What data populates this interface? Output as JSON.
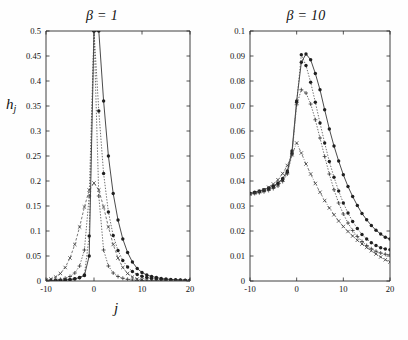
{
  "figure": {
    "background": "#fefefe",
    "ink_color": "#1f1f1f"
  },
  "panels": [
    {
      "id": "left",
      "title_symbol": "β",
      "title_eq": "=",
      "title_value": "1",
      "title_full": "β = 1",
      "ylabel": "h",
      "ylabel_sub": "j",
      "xlabel": "j"
    },
    {
      "id": "right",
      "title_symbol": "β",
      "title_eq": "=",
      "title_value": "10",
      "title_full": "β = 10",
      "ylabel": "h",
      "ylabel_sub": "j",
      "xlabel": "j"
    }
  ],
  "chart_data": [
    {
      "type": "line",
      "panel": "left",
      "title": "β = 1",
      "xlabel": "j",
      "ylabel": "h_j",
      "xlim": [
        -10,
        20
      ],
      "ylim": [
        0,
        0.5
      ],
      "xticks": [
        -10,
        0,
        10,
        20
      ],
      "xticklabels": [
        "-10",
        "0",
        "10",
        "20"
      ],
      "yticks": [
        0,
        0.05,
        0.1,
        0.15,
        0.2,
        0.25,
        0.3,
        0.35,
        0.4,
        0.45,
        0.5
      ],
      "yticklabels": [
        "0",
        "0.05",
        "0.1",
        "0.15",
        "0.2",
        "0.25",
        "0.3",
        "0.35",
        "0.4",
        "0.45",
        "0.5"
      ],
      "grid": false,
      "legend": "none",
      "x": [
        -10,
        -9,
        -8,
        -7,
        -6,
        -5,
        -4,
        -3,
        -2,
        -1,
        0,
        1,
        2,
        3,
        4,
        5,
        6,
        7,
        8,
        9,
        10,
        11,
        12,
        13,
        14,
        15,
        16,
        17,
        18,
        19,
        20
      ],
      "series": [
        {
          "name": "curve-1",
          "style": "solid",
          "marker": "filled-circle",
          "values": [
            0.0005,
            0.0007,
            0.001,
            0.0014,
            0.002,
            0.003,
            0.0045,
            0.007,
            0.011,
            0.05,
            0.5,
            0.5,
            0.36,
            0.25,
            0.175,
            0.122,
            0.084,
            0.057,
            0.038,
            0.025,
            0.017,
            0.012,
            0.009,
            0.007,
            0.005,
            0.004,
            0.003,
            0.0025,
            0.002,
            0.0017,
            0.0015
          ]
        },
        {
          "name": "curve-2",
          "style": "dotted",
          "marker": "filled-circle",
          "values": [
            0.0004,
            0.0006,
            0.0009,
            0.0013,
            0.0019,
            0.0028,
            0.0042,
            0.0065,
            0.012,
            0.09,
            0.5,
            0.34,
            0.215,
            0.138,
            0.091,
            0.061,
            0.041,
            0.028,
            0.019,
            0.013,
            0.0095,
            0.007,
            0.0055,
            0.0042,
            0.0033,
            0.0027,
            0.0022,
            0.0018,
            0.0015,
            0.0013,
            0.0011
          ]
        },
        {
          "name": "curve-3",
          "style": "dotted",
          "marker": "plus",
          "values": [
            0.0008,
            0.0012,
            0.002,
            0.0033,
            0.0055,
            0.009,
            0.016,
            0.03,
            0.062,
            0.17,
            0.5,
            0.17,
            0.062,
            0.03,
            0.016,
            0.009,
            0.0055,
            0.0033,
            0.002,
            0.0013,
            0.0009,
            0.0007,
            0.0005,
            0.0004,
            0.0003,
            0.00025,
            0.0002,
            0.00017,
            0.00015,
            0.00013,
            0.0001
          ]
        },
        {
          "name": "curve-4",
          "style": "dashed",
          "marker": "cross",
          "values": [
            0.002,
            0.004,
            0.008,
            0.015,
            0.027,
            0.046,
            0.073,
            0.108,
            0.148,
            0.182,
            0.196,
            0.182,
            0.148,
            0.108,
            0.073,
            0.046,
            0.027,
            0.015,
            0.008,
            0.004,
            0.002,
            0.0012,
            0.0008,
            0.0005,
            0.0004,
            0.0003,
            0.0002,
            0.00015,
            0.0001,
            8e-05,
            6e-05
          ]
        }
      ]
    },
    {
      "type": "line",
      "panel": "right",
      "title": "β = 10",
      "xlabel": "j",
      "ylabel": "h_j",
      "xlim": [
        -10,
        20
      ],
      "ylim": [
        0,
        0.1
      ],
      "xticks": [
        -10,
        0,
        10,
        20
      ],
      "xticklabels": [
        "-10",
        "0",
        "10",
        "20"
      ],
      "yticks": [
        0,
        0.01,
        0.02,
        0.03,
        0.04,
        0.05,
        0.06,
        0.07,
        0.08,
        0.09,
        0.1
      ],
      "yticklabels": [
        "0",
        "0.01",
        "0.02",
        "0.03",
        "0.04",
        "0.05",
        "0.06",
        "0.07",
        "0.08",
        "0.09",
        "0.1"
      ],
      "grid": false,
      "legend": "none",
      "x": [
        -10,
        -9,
        -8,
        -7,
        -6,
        -5,
        -4,
        -3,
        -2,
        -1,
        0,
        1,
        2,
        3,
        4,
        5,
        6,
        7,
        8,
        9,
        10,
        11,
        12,
        13,
        14,
        15,
        16,
        17,
        18,
        19,
        20
      ],
      "series": [
        {
          "name": "curve-1",
          "style": "solid",
          "marker": "filled-circle",
          "values": [
            0.035,
            0.0355,
            0.036,
            0.0365,
            0.0372,
            0.038,
            0.0392,
            0.041,
            0.044,
            0.052,
            0.072,
            0.0875,
            0.0908,
            0.0885,
            0.083,
            0.0765,
            0.0685,
            0.0608,
            0.054,
            0.048,
            0.0425,
            0.0378,
            0.0338,
            0.0302,
            0.027,
            0.0245,
            0.0222,
            0.0203,
            0.0188,
            0.0175,
            0.0168
          ]
        },
        {
          "name": "curve-2",
          "style": "dotted",
          "marker": "filled-circle",
          "values": [
            0.035,
            0.0353,
            0.0357,
            0.0362,
            0.0368,
            0.0376,
            0.0388,
            0.0405,
            0.0435,
            0.0512,
            0.0715,
            0.0905,
            0.0862,
            0.0795,
            0.0715,
            0.0632,
            0.0552,
            0.0478,
            0.0415,
            0.036,
            0.0312,
            0.0272,
            0.0238,
            0.021,
            0.0186,
            0.0168,
            0.0153,
            0.0142,
            0.0133,
            0.0128,
            0.0125
          ]
        },
        {
          "name": "curve-3",
          "style": "dotted",
          "marker": "plus",
          "values": [
            0.0348,
            0.035,
            0.0353,
            0.0357,
            0.0362,
            0.037,
            0.038,
            0.0398,
            0.0428,
            0.0505,
            0.0705,
            0.0765,
            0.0752,
            0.0708,
            0.0645,
            0.0572,
            0.0498,
            0.0428,
            0.0365,
            0.0312,
            0.0268,
            0.0232,
            0.0202,
            0.0178,
            0.0158,
            0.0142,
            0.0129,
            0.0119,
            0.0112,
            0.0107,
            0.0105
          ]
        },
        {
          "name": "curve-4",
          "style": "dashdot",
          "marker": "cross",
          "values": [
            0.0348,
            0.0352,
            0.0358,
            0.0365,
            0.0375,
            0.0388,
            0.0405,
            0.043,
            0.0462,
            0.0505,
            0.0552,
            0.0512,
            0.0468,
            0.0428,
            0.039,
            0.0355,
            0.0322,
            0.0292,
            0.0265,
            0.024,
            0.0218,
            0.0198,
            0.018,
            0.0163,
            0.0148,
            0.0134,
            0.0121,
            0.0108,
            0.0096,
            0.0085,
            0.0076
          ]
        }
      ]
    }
  ]
}
